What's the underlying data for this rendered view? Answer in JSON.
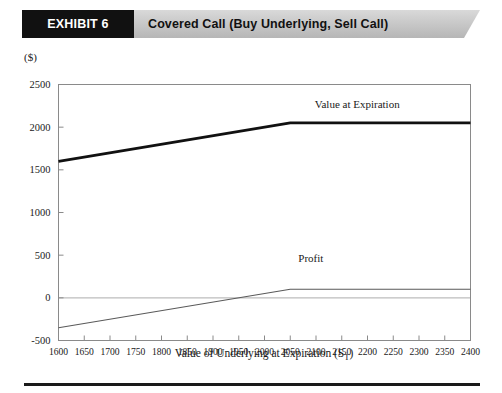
{
  "header": {
    "tag": "EXHIBIT 6",
    "title": "Covered Call (Buy Underlying, Sell Call)"
  },
  "colors": {
    "banner_tag_bg": "#111111",
    "banner_bg": "#c9c9c9",
    "value_line": "#111111",
    "profit_line": "#5a5a5a",
    "zero_line": "#bdbdbd",
    "frame": "#8a8a8a"
  },
  "chart_data": {
    "type": "line",
    "title": "Covered Call (Buy Underlying, Sell Call)",
    "xlabel": "Value of Underlying at Expiration (S",
    "xlabel_subscript": "T",
    "xlabel_suffix": ")",
    "ylabel": "($)",
    "xlim": [
      1600,
      2400
    ],
    "ylim": [
      -500,
      2500
    ],
    "xticks": [
      1600,
      1650,
      1700,
      1750,
      1800,
      1850,
      1900,
      1950,
      2000,
      2050,
      2100,
      2150,
      2200,
      2250,
      2300,
      2350,
      2400
    ],
    "yticks": [
      -500,
      0,
      500,
      1000,
      1500,
      2000,
      2500
    ],
    "grid": false,
    "zero_line": 0,
    "legend_position": "inline-annotations",
    "strike": 2050,
    "series": [
      {
        "name": "Value  at Expiration",
        "label_x": 2180,
        "label_y": 2230,
        "x": [
          1600,
          2050,
          2400
        ],
        "values": [
          1600,
          2050,
          2050
        ]
      },
      {
        "name": "Profit",
        "label_x": 2090,
        "label_y": 420,
        "x": [
          1600,
          2050,
          2400
        ],
        "values": [
          -350,
          100,
          100
        ]
      }
    ]
  },
  "annotations": [
    {
      "text": "Value  at Expiration",
      "name": "value-at-expiration-label"
    },
    {
      "text": "Profit",
      "name": "profit-label"
    }
  ],
  "axis": {
    "y_unit": "($)",
    "x_title_main": "Value of Underlying at Expiration (S",
    "x_title_sub": "T",
    "x_title_end": ")"
  }
}
